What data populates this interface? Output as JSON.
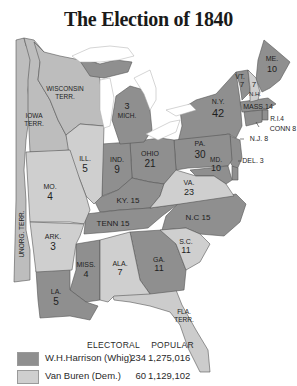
{
  "title": "The Election of 1840",
  "colors": {
    "whig": "#8f8f8f",
    "democrat": "#cfcfcf",
    "territory": "#bdbdbd",
    "water": "#ffffff",
    "border": "#555555"
  },
  "states": [
    {
      "name": "ME.",
      "electoral": "10",
      "party": "whig"
    },
    {
      "name": "VT.",
      "electoral": "7",
      "party": "whig"
    },
    {
      "name": "N.H.",
      "electoral": "7",
      "party": "democrat"
    },
    {
      "name": "MASS.",
      "electoral": "14",
      "party": "whig"
    },
    {
      "name": "R.I.",
      "electoral": "4",
      "party": "whig"
    },
    {
      "name": "CONN",
      "electoral": "8",
      "party": "whig"
    },
    {
      "name": "N.Y.",
      "electoral": "42",
      "party": "whig"
    },
    {
      "name": "N.J.",
      "electoral": "8",
      "party": "whig"
    },
    {
      "name": "PA.",
      "electoral": "30",
      "party": "whig"
    },
    {
      "name": "DEL.",
      "electoral": "3",
      "party": "whig"
    },
    {
      "name": "MD.",
      "electoral": "10",
      "party": "whig"
    },
    {
      "name": "VA.",
      "electoral": "23",
      "party": "democrat"
    },
    {
      "name": "N.C.",
      "electoral": "15",
      "party": "whig"
    },
    {
      "name": "S.C.",
      "electoral": "11",
      "party": "democrat"
    },
    {
      "name": "GA.",
      "electoral": "11",
      "party": "whig"
    },
    {
      "name": "ALA.",
      "electoral": "7",
      "party": "democrat"
    },
    {
      "name": "MISS.",
      "electoral": "4",
      "party": "whig"
    },
    {
      "name": "LA.",
      "electoral": "5",
      "party": "whig"
    },
    {
      "name": "ARK.",
      "electoral": "3",
      "party": "democrat"
    },
    {
      "name": "TENN",
      "electoral": "15",
      "party": "whig"
    },
    {
      "name": "KY.",
      "electoral": "15",
      "party": "whig"
    },
    {
      "name": "OHIO",
      "electoral": "21",
      "party": "whig"
    },
    {
      "name": "IND.",
      "electoral": "9",
      "party": "whig"
    },
    {
      "name": "ILL.",
      "electoral": "5",
      "party": "democrat"
    },
    {
      "name": "MO.",
      "electoral": "4",
      "party": "democrat"
    },
    {
      "name": "MICH.",
      "electoral": "3",
      "party": "whig"
    }
  ],
  "territories": [
    "WISCONSIN TERR.",
    "IOWA TERR.",
    "UNORG. TERR.",
    "FLA. TERR."
  ],
  "labels": {
    "me": "ME.",
    "me_ev": "10",
    "vt": "VT.",
    "vt_ev": "7",
    "nh": "N.H.",
    "nh_ev": "7",
    "mass": "MASS.14",
    "ri": "R.I.4",
    "conn": "CONN 8",
    "ny": "N.Y.",
    "ny_ev": "42",
    "nj": "N.J. 8",
    "pa": "PA.",
    "pa_ev": "30",
    "del": "DEL. 3",
    "md": "MD.",
    "md_ev": "10",
    "va": "VA.",
    "va_ev": "23",
    "nc": "N.C 15",
    "sc": "S.C.",
    "sc_ev": "11",
    "ga": "GA.",
    "ga_ev": "11",
    "ala": "ALA.",
    "ala_ev": "7",
    "miss": "MISS.",
    "miss_ev": "4",
    "la": "LA.",
    "la_ev": "5",
    "ark": "ARK.",
    "ark_ev": "3",
    "tenn": "TENN 15",
    "ky": "KY. 15",
    "ohio": "OHIO",
    "ohio_ev": "21",
    "ind": "IND.",
    "ind_ev": "9",
    "ill": "ILL.",
    "ill_ev": "5",
    "mo": "MO.",
    "mo_ev": "4",
    "mich": "MICH.",
    "mich_ev": "3",
    "wisc1": "WISCONSIN",
    "wisc2": "TERR.",
    "iowa1": "IOWA",
    "iowa2": "TERR.",
    "unorg": "UNORG. TERR.",
    "fla1": "FLA.",
    "fla2": "TERR."
  },
  "legend": {
    "col_electoral": "ELECTORAL",
    "col_popular": "POPULAR",
    "rows": [
      {
        "candidate": "W.H.Harrison (Whig)",
        "electoral": "234",
        "popular": "1,275,016",
        "color": "#8f8f8f"
      },
      {
        "candidate": "Van Buren (Dem.)",
        "electoral": "60",
        "popular": "1,129,102",
        "color": "#cfcfcf"
      }
    ]
  }
}
